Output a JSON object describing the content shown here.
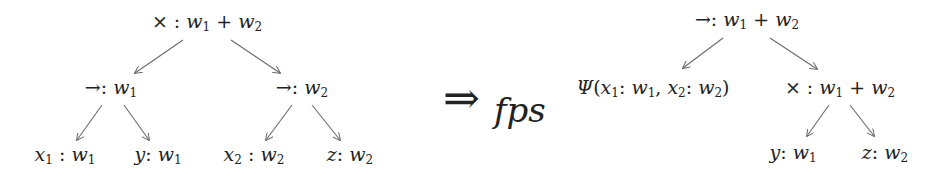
{
  "diagram": {
    "type": "tree-transformation",
    "transformation": {
      "arrow": "⇒",
      "subscript": "fps"
    },
    "left_tree": {
      "root": {
        "op": "×",
        "type_w1": "w",
        "sub1": "1",
        "plus": "+",
        "type_w2": "w",
        "sub2": "2"
      },
      "children": [
        {
          "op": "→",
          "w": "w",
          "sub": "1",
          "leaves": [
            {
              "var": "x",
              "var_sub": "1",
              "w": "w",
              "sub": "1"
            },
            {
              "var": "y",
              "var_sub": "",
              "w": "w",
              "sub": "1"
            }
          ]
        },
        {
          "op": "→",
          "w": "w",
          "sub": "2",
          "leaves": [
            {
              "var": "x",
              "var_sub": "2",
              "w": "w",
              "sub": "2"
            },
            {
              "var": "z",
              "var_sub": "",
              "w": "w",
              "sub": "2"
            }
          ]
        }
      ]
    },
    "right_tree": {
      "root": {
        "op": "→",
        "w1": "w",
        "sub1": "1",
        "plus": "+",
        "w2": "w",
        "sub2": "2"
      },
      "psi_node": {
        "psi": "Ψ",
        "open": "(",
        "x1": "x",
        "x1_sub": "1",
        "w1": "w",
        "w1_sub": "1",
        "comma": ",",
        "x2": "x",
        "x2_sub": "2",
        "w2": "w",
        "w2_sub": "2",
        "close": ")"
      },
      "times_node": {
        "op": "×",
        "w1": "w",
        "sub1": "1",
        "plus": "+",
        "w2": "w",
        "sub2": "2"
      },
      "leaves": [
        {
          "var": "y",
          "w": "w",
          "sub": "1"
        },
        {
          "var": "z",
          "w": "w",
          "sub": "2"
        }
      ]
    },
    "colon": ":",
    "edge_color": "#6a6a6a"
  }
}
